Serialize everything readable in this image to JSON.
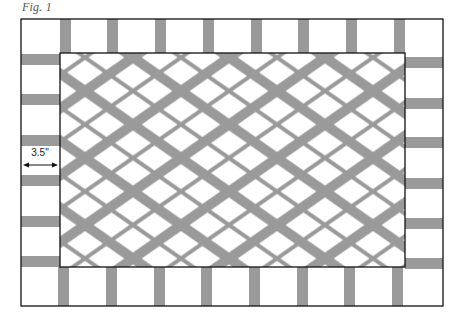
{
  "figure": {
    "label": "Fig. 1",
    "dimension_label": "3.5\"",
    "colors": {
      "background": "#ffffff",
      "stripe": "#9a9a9a",
      "outline": "#111111"
    },
    "outer_border": {
      "x": 21,
      "y": 19,
      "w": 422,
      "h": 287
    },
    "inner_panel": {
      "x": 60,
      "y": 53,
      "w": 345,
      "h": 214
    },
    "border_stripe_width": 11,
    "lattice": {
      "horizontal_period": 96,
      "vertical_period": 67,
      "thick_band": 10,
      "thin_band": 4
    }
  }
}
